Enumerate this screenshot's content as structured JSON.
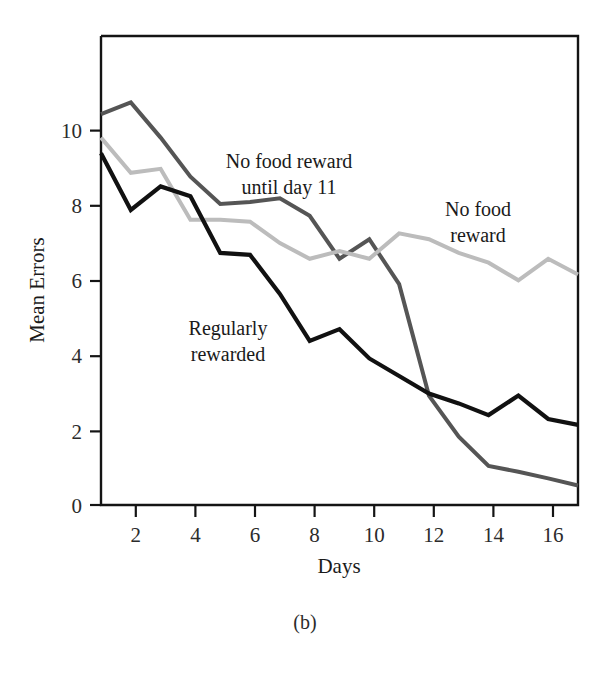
{
  "figure": {
    "caption": "(b)",
    "background": "#ffffff"
  },
  "chart_data": {
    "type": "line",
    "title": "",
    "xlabel": "Days",
    "ylabel": "Mean Errors",
    "x": [
      1,
      2,
      3,
      4,
      5,
      6,
      7,
      8,
      9,
      10,
      11,
      12,
      13,
      14,
      15,
      16,
      17
    ],
    "xlim": [
      1,
      17
    ],
    "ylim": [
      0,
      12
    ],
    "xticks": [
      2,
      4,
      6,
      8,
      10,
      12,
      14,
      16
    ],
    "yticks": [
      0,
      2,
      4,
      6,
      8,
      10
    ],
    "xtick_labels": [
      "2",
      "4",
      "6",
      "8",
      "10",
      "12",
      "14",
      "16"
    ],
    "ytick_labels": [
      "0",
      "2",
      "4",
      "6",
      "8",
      "10"
    ],
    "grid": false,
    "legend": "inline-annotations",
    "series": [
      {
        "name": "No food reward until day 11",
        "color": "#555555",
        "width": 4.0,
        "values": [
          10.0,
          10.3,
          9.4,
          8.4,
          7.7,
          7.75,
          7.85,
          7.4,
          6.3,
          6.8,
          5.65,
          2.8,
          1.75,
          1.0,
          0.85,
          0.68,
          0.5
        ]
      },
      {
        "name": "No food reward",
        "color": "#bcbcbc",
        "width": 4.0,
        "values": [
          9.4,
          8.5,
          8.6,
          7.3,
          7.3,
          7.25,
          6.7,
          6.3,
          6.5,
          6.3,
          6.95,
          6.8,
          6.45,
          6.2,
          5.75,
          6.3,
          5.9
        ]
      },
      {
        "name": "Regularly rewarded",
        "color": "#111111",
        "width": 4.2,
        "values": [
          9.0,
          7.55,
          8.15,
          7.9,
          6.45,
          6.4,
          5.4,
          4.2,
          4.5,
          3.75,
          3.3,
          2.85,
          2.6,
          2.3,
          2.8,
          2.2,
          2.05
        ]
      }
    ],
    "annotations": [
      {
        "id": "annotation-no-food-until-11",
        "lines": [
          "No food reward",
          "until day 11"
        ],
        "x": 289,
        "y": 168,
        "anchor": "middle"
      },
      {
        "id": "annotation-no-food-reward",
        "lines": [
          "No food",
          "reward"
        ],
        "x": 478,
        "y": 216,
        "anchor": "middle"
      },
      {
        "id": "annotation-regularly-rewarded",
        "lines": [
          "Regularly",
          "rewarded"
        ],
        "x": 228,
        "y": 335,
        "anchor": "middle"
      }
    ]
  },
  "geometry": {
    "plot_left": 101,
    "plot_right": 578,
    "plot_top": 36,
    "plot_bottom": 505
  }
}
